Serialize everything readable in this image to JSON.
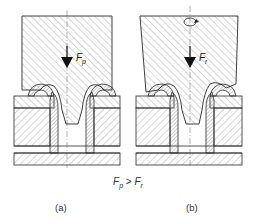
{
  "figure": {
    "panels": [
      {
        "id": "a",
        "caption": "(a)",
        "force_symbol": "F",
        "force_subscript": "p",
        "tool": "vertical punch"
      },
      {
        "id": "b",
        "caption": "(b)",
        "force_symbol": "F",
        "force_subscript": "r",
        "tool": "tilted rotating tool",
        "rotation_icon": "rotation-arrow-icon"
      }
    ],
    "relation": {
      "left_symbol": "F",
      "left_subscript": "p",
      "operator": " > ",
      "right_symbol": "F",
      "right_subscript": "r"
    },
    "colors": {
      "line": "#2a2a2a",
      "hatch": "#8a8a8a",
      "background": "#ffffff"
    }
  }
}
